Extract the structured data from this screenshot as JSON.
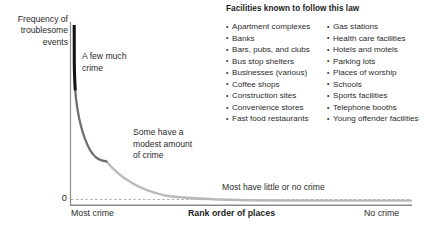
{
  "chart_data": {
    "type": "line",
    "title": "",
    "xlabel": "Rank order of places",
    "ylabel": "Frequency of troublesome events",
    "x_tick_labels": [
      "Most crime",
      "No crime"
    ],
    "y_tick_labels": [
      "0"
    ],
    "grid": false,
    "legend": "none",
    "xlim": [
      0,
      100
    ],
    "ylim": [
      0,
      100
    ],
    "series": [
      {
        "name": "high-crime-head",
        "color": "#111111",
        "x": [
          1.0,
          1.05,
          1.15,
          1.3,
          1.6,
          2.0
        ],
        "y": [
          100.0,
          92.0,
          80.0,
          68.0,
          58.0,
          50.0
        ]
      },
      {
        "name": "moderate-crime-body",
        "color": "#666666",
        "x": [
          2.0,
          3.0,
          4.5,
          6.5,
          9.0,
          12.0,
          16.0
        ],
        "y": [
          50.0,
          37.0,
          27.0,
          20.0,
          15.0,
          11.0,
          8.0
        ]
      },
      {
        "name": "low-crime-tail",
        "color": "#b5b5b5",
        "x": [
          16.0,
          22.0,
          30.0,
          40.0,
          55.0,
          70.0,
          85.0,
          100.0
        ],
        "y": [
          8.0,
          5.5,
          3.6,
          2.2,
          1.2,
          0.6,
          0.25,
          0.0
        ]
      }
    ],
    "annotations": [
      {
        "id": "high",
        "text": "A few much\ncrime"
      },
      {
        "id": "mid",
        "text": "Some have a\nmodest amount\nof crime"
      },
      {
        "id": "low",
        "text": "Most have little or no crime"
      }
    ],
    "baseline_style": "dashed",
    "colors": {
      "axis": "#8a8a8a",
      "baseline_dash": "#9a9a9a",
      "head": "#111111",
      "body": "#666666",
      "tail": "#b5b5b5",
      "text": "#2b2b2b",
      "background": "#ffffff"
    }
  },
  "axes": {
    "y_title": "Frequency of\ntroublesome\nevents",
    "zero_tick": "0",
    "x_title": "Rank order of places",
    "x_left_label": "Most crime",
    "x_right_label": "No crime"
  },
  "annotations": {
    "high_crime": "A few much\ncrime",
    "moderate_crime": "Some have a\nmodest amount\nof crime",
    "low_crime": "Most have little or no crime"
  },
  "facilities": {
    "title": "Facilities known to follow this law",
    "column_left": [
      "Apartment complexes",
      "Banks",
      "Bars, pubs, and clubs",
      "Bus stop shelters",
      "Businesses (various)",
      "Coffee shops",
      "Construction sites",
      "Convenience stores",
      "Fast food restaurants"
    ],
    "column_right": [
      "Gas stations",
      "Health care facilities",
      "Hotels and motels",
      "Parking lots",
      "Places of worship",
      "Schools",
      "Sports facilities",
      "Telephone booths",
      "Young offender facilities"
    ]
  }
}
